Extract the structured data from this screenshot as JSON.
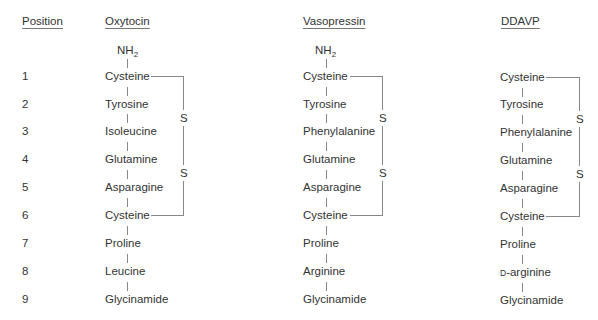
{
  "headers": {
    "position": "Position",
    "oxytocin": "Oxytocin",
    "vasopressin": "Vasopressin",
    "ddavp": "DDAVP"
  },
  "positions": [
    "1",
    "2",
    "3",
    "4",
    "5",
    "6",
    "7",
    "8",
    "9"
  ],
  "n_terminus": {
    "label": "NH",
    "subscript": "2"
  },
  "disulfide_label": "S",
  "oxytocin": {
    "n_terminus_shown": true,
    "residues": [
      "Cysteine",
      "Tyrosine",
      "Isoleucine",
      "Glutamine",
      "Asparagine",
      "Cysteine",
      "Proline",
      "Leucine",
      "Glycinamide"
    ]
  },
  "vasopressin": {
    "n_terminus_shown": true,
    "residues": [
      "Cysteine",
      "Tyrosine",
      "Phenylalanine",
      "Glutamine",
      "Asparagine",
      "Cysteine",
      "Proline",
      "Arginine",
      "Glycinamide"
    ]
  },
  "ddavp": {
    "n_terminus_shown": false,
    "residues": [
      "Cysteine",
      "Tyrosine",
      "Phenylalanine",
      "Glutamine",
      "Asparagine",
      "Cysteine",
      "Proline",
      "D-arginine",
      "Glycinamide"
    ],
    "d_prefix": "D",
    "d_rest": "-arginine"
  }
}
